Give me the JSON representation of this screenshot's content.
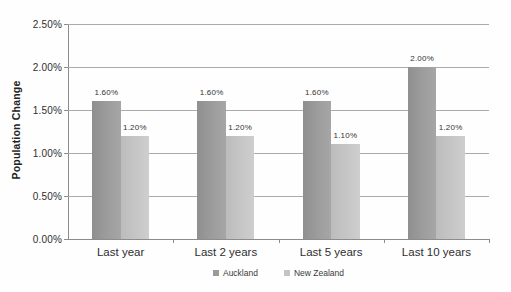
{
  "chart_data": {
    "type": "bar",
    "title": "",
    "ylabel": "Population Change",
    "xlabel": "",
    "categories": [
      "Last year",
      "Last 2 years",
      "Last 5 years",
      "Last 10 years"
    ],
    "series": [
      {
        "name": "Auckland",
        "color": "#9a9a9a",
        "values": [
          1.6,
          1.6,
          1.6,
          2.0
        ],
        "data_labels": [
          "1.60%",
          "1.60%",
          "1.60%",
          "2.00%"
        ]
      },
      {
        "name": "New Zealand",
        "color": "#c4c4c4",
        "values": [
          1.2,
          1.2,
          1.1,
          1.2
        ],
        "data_labels": [
          "1.20%",
          "1.20%",
          "1.10%",
          "1.20%"
        ]
      }
    ],
    "y_axis": {
      "min": 0,
      "max": 2.5,
      "tick_interval": 0.5,
      "tick_labels": [
        "0.00%",
        "0.50%",
        "1.00%",
        "1.50%",
        "2.00%",
        "2.50%"
      ]
    },
    "legend_position": "bottom",
    "grid": true
  }
}
